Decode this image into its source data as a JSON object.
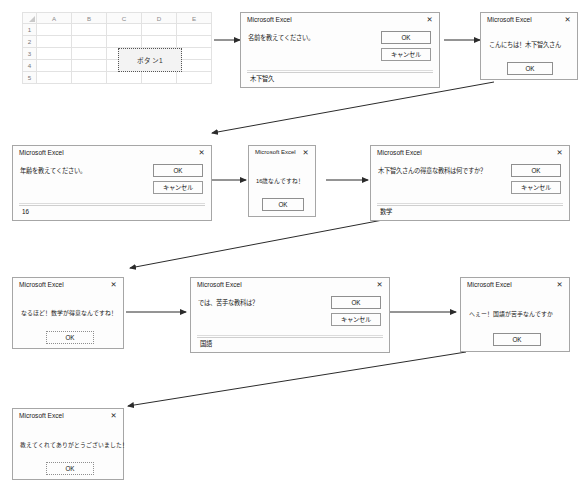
{
  "spreadsheet": {
    "column_headers": [
      "A",
      "B",
      "C",
      "D",
      "E"
    ],
    "row_headers": [
      "1",
      "2",
      "3",
      "4",
      "5"
    ],
    "button_label": "ボタン1"
  },
  "dialog_title": "Microsoft Excel",
  "close_glyph": "✕",
  "labels": {
    "ok": "OK",
    "cancel": "キャンセル"
  },
  "dialogs": [
    {
      "id": "ask-name",
      "kind": "input",
      "title": "Microsoft Excel",
      "prompt": "名前を教えてください。",
      "value": "木下智久",
      "ok": "OK",
      "cancel": "キャンセル"
    },
    {
      "id": "greet-name",
      "kind": "msg",
      "title": "Microsoft Excel",
      "prompt": "こんにちは！木下智久さん",
      "ok": "OK"
    },
    {
      "id": "ask-age",
      "kind": "input",
      "title": "Microsoft Excel",
      "prompt": "年齢を教えてください。",
      "value": "16",
      "ok": "OK",
      "cancel": "キャンセル"
    },
    {
      "id": "confirm-age",
      "kind": "msg",
      "title": "Microsoft Excel",
      "prompt": "16歳なんですね！",
      "ok": "OK"
    },
    {
      "id": "ask-best-subject",
      "kind": "input",
      "title": "Microsoft Excel",
      "prompt": "木下智久さんの得意な教科は何ですか？",
      "value": "数学",
      "ok": "OK",
      "cancel": "キャンセル"
    },
    {
      "id": "confirm-best-subject",
      "kind": "msg",
      "title": "Microsoft Excel",
      "prompt": "なるほど！数学が得意なんですね！",
      "ok": "OK"
    },
    {
      "id": "ask-worst-subject",
      "kind": "input",
      "title": "Microsoft Excel",
      "prompt": "では、苦手な教科は？",
      "value": "国語",
      "ok": "OK",
      "cancel": "キャンセル"
    },
    {
      "id": "confirm-worst-subject",
      "kind": "msg",
      "title": "Microsoft Excel",
      "prompt": "へぇー！国語が苦手なんですか",
      "ok": "OK"
    },
    {
      "id": "thanks",
      "kind": "msg",
      "title": "Microsoft Excel",
      "prompt": "教えてくれてありがとうございました！",
      "ok": "OK"
    }
  ]
}
